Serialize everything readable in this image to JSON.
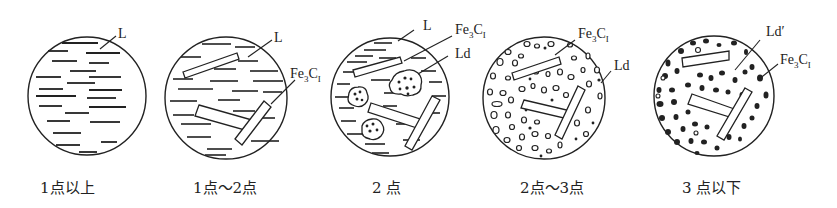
{
  "figure": {
    "panels": [
      {
        "id": "p1",
        "caption": "1点以上",
        "labels": [
          "L"
        ]
      },
      {
        "id": "p2",
        "caption": "1点～2点",
        "labels": [
          "L",
          "Fe3CI"
        ]
      },
      {
        "id": "p3",
        "caption": "2 点",
        "labels": [
          "L",
          "Fe3CI",
          "Ld"
        ]
      },
      {
        "id": "p4",
        "caption": "2点～3点",
        "labels": [
          "Fe3CI",
          "Ld"
        ]
      },
      {
        "id": "p5",
        "caption": "3 点以下",
        "labels": [
          "Ld′",
          "Fe3CI"
        ]
      }
    ],
    "label_text": {
      "L": "L",
      "Fe": "Fe",
      "sub3": "3",
      "C": "C",
      "subI": "I",
      "Ld": "Ld",
      "Ldp": "Ld′"
    },
    "colors": {
      "ink": "#222222",
      "background": "#ffffff"
    }
  }
}
